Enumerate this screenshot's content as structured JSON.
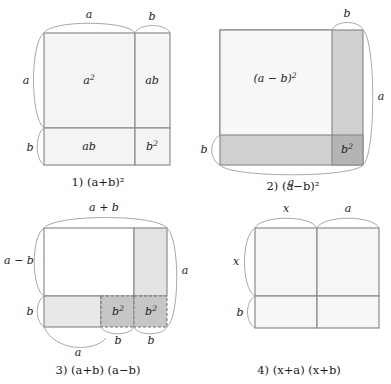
{
  "page": {
    "background_color": "#ffffff",
    "ink_color": "#1a1a1a"
  },
  "palette": {
    "stroke": "#8c8c8c",
    "brace_stroke": "#a8a8a8",
    "fill_white": "#ffffff",
    "fill_light": "#f4f4f4",
    "fill_medium": "#d0d0d0",
    "fill_dark": "#b4b4b4",
    "dash_stroke": "#6f6f6f"
  },
  "figures": [
    {
      "id": "fig1",
      "number": "1)",
      "caption_parts": [
        "(",
        "a",
        "+",
        "b",
        ")",
        "2"
      ],
      "caption_text": "1) (a+b)²",
      "edge_labels": {
        "top_left": "a",
        "top_right": "b",
        "left_upper": "a",
        "left_lower": "b"
      },
      "regions": [
        {
          "name": "a-squared",
          "label": "a",
          "exponent": "2",
          "shade": "light"
        },
        {
          "name": "ab-top-right",
          "label": "ab",
          "exponent": "",
          "shade": "light"
        },
        {
          "name": "ab-bottom-left",
          "label": "ab",
          "exponent": "",
          "shade": "light"
        },
        {
          "name": "b-squared",
          "label": "b",
          "exponent": "2",
          "shade": "light"
        }
      ]
    },
    {
      "id": "fig2",
      "number": "2)",
      "caption_text": "2) (a−b)²",
      "edge_labels": {
        "top_right": "b",
        "right": "a",
        "left_lower": "b",
        "bottom": "a"
      },
      "regions": [
        {
          "name": "a-minus-b-squared",
          "label": "(a − b)",
          "exponent": "2",
          "shade": "light"
        },
        {
          "name": "right-strip",
          "label": "",
          "exponent": "",
          "shade": "medium"
        },
        {
          "name": "bottom-strip",
          "label": "",
          "exponent": "",
          "shade": "medium"
        },
        {
          "name": "b-squared",
          "label": "b",
          "exponent": "2",
          "shade": "dark"
        }
      ]
    },
    {
      "id": "fig3",
      "number": "3)",
      "caption_text": "3) (a+b) (a−b)",
      "edge_labels": {
        "top": "a + b",
        "left_upper": "a − b",
        "left_lower": "b",
        "right": "a",
        "bottom_mid": "b",
        "bottom_right": "b",
        "bottom": "a"
      },
      "regions": [
        {
          "name": "main-white",
          "label": "",
          "exponent": "",
          "shade": "white"
        },
        {
          "name": "right-column",
          "label": "",
          "exponent": "",
          "shade": "light"
        },
        {
          "name": "bottom-left-strip",
          "label": "",
          "exponent": "",
          "shade": "light"
        },
        {
          "name": "b-squared-left",
          "label": "b",
          "exponent": "2",
          "shade": "medium"
        },
        {
          "name": "b-squared-right",
          "label": "b",
          "exponent": "2",
          "shade": "medium"
        }
      ]
    },
    {
      "id": "fig4",
      "number": "4)",
      "caption_text": "4) (x+a) (x+b)",
      "edge_labels": {
        "top_left": "x",
        "top_right": "a",
        "left_upper": "x",
        "left_lower": "b"
      },
      "regions": [
        {
          "name": "top-left",
          "label": "",
          "exponent": "",
          "shade": "light"
        },
        {
          "name": "top-right",
          "label": "",
          "exponent": "",
          "shade": "light"
        },
        {
          "name": "bottom-left",
          "label": "",
          "exponent": "",
          "shade": "light"
        },
        {
          "name": "bottom-right",
          "label": "",
          "exponent": "",
          "shade": "light"
        }
      ]
    }
  ]
}
